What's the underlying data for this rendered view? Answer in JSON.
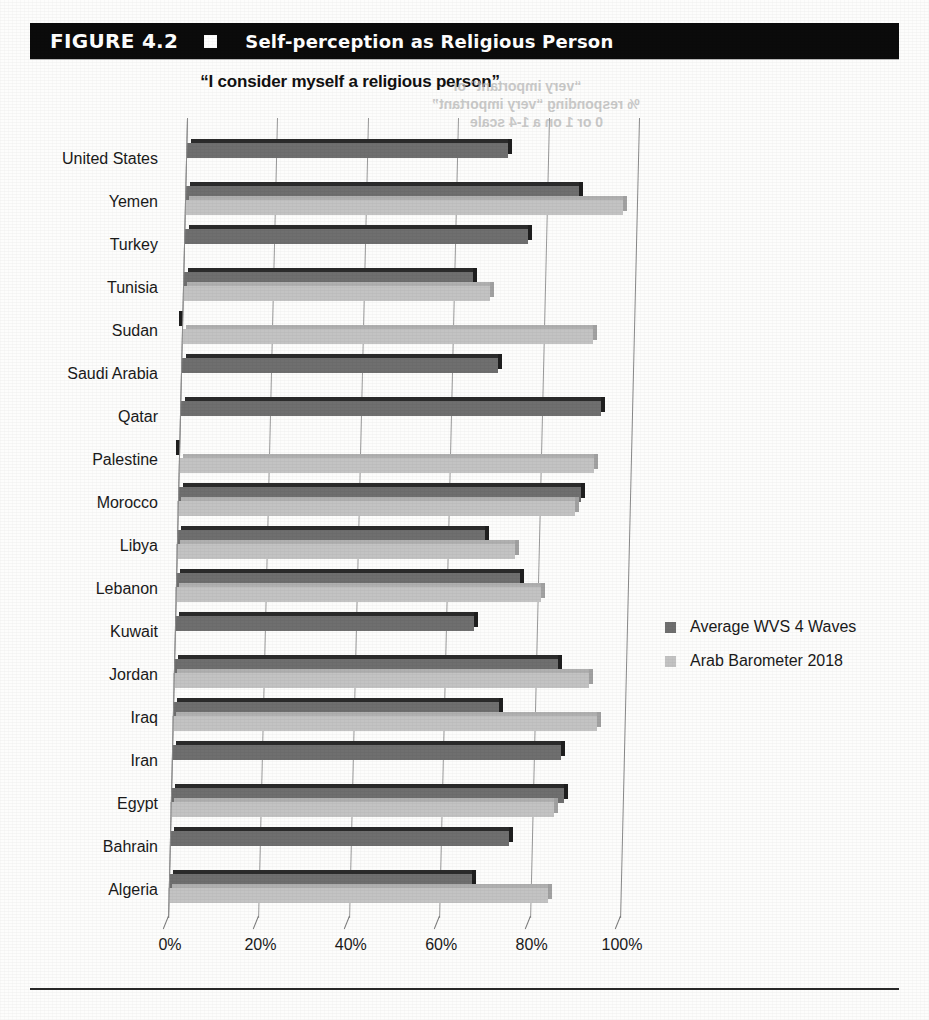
{
  "header": {
    "figure_number": "FIGURE 4.2",
    "title": "Self-perception as Religious Person",
    "marker_icon": "filled-square-icon"
  },
  "subtitle": "“I consider myself a religious person”",
  "scan_artifact": {
    "note": "mirrored bleed-through text from reverse page",
    "line1": "“very important” or",
    "line2": "% responding “very important”",
    "line3": "0 or 1 on a 1-4 scale"
  },
  "legend": {
    "position": "right",
    "items": [
      {
        "label": "Average WVS 4 Waves",
        "color": "#6f6f6f",
        "swatch_icon": "legend-swatch-icon"
      },
      {
        "label": "Arab Barometer 2018",
        "color": "#c3c3c3",
        "swatch_icon": "legend-swatch-icon"
      }
    ]
  },
  "axis": {
    "x_ticks": [
      "0%",
      "20%",
      "40%",
      "60%",
      "80%",
      "100%"
    ],
    "x_min": 0,
    "x_max": 100
  },
  "chart_data": {
    "type": "bar",
    "orientation": "horizontal",
    "title": "Self-perception as Religious Person",
    "subtitle": "“I consider myself a religious person”",
    "xlabel": "",
    "ylabel": "",
    "xlim": [
      0,
      100
    ],
    "xticks": [
      0,
      20,
      40,
      60,
      80,
      100
    ],
    "xtick_labels": [
      "0%",
      "20%",
      "40%",
      "60%",
      "80%",
      "100%"
    ],
    "grid": true,
    "legend_position": "right",
    "units": "percent",
    "categories": [
      "United States",
      "Yemen",
      "Turkey",
      "Tunisia",
      "Sudan",
      "Saudi Arabia",
      "Qatar",
      "Palestine",
      "Morocco",
      "Libya",
      "Lebanon",
      "Kuwait",
      "Jordan",
      "Iraq",
      "Iran",
      "Egypt",
      "Bahrain",
      "Algeria"
    ],
    "series": [
      {
        "name": "Average WVS 4 Waves",
        "color": "#6f6f6f",
        "values": [
          71,
          87,
          76,
          64,
          null,
          70,
          93,
          null,
          89,
          68,
          76,
          66,
          85,
          72,
          86,
          87,
          75,
          67
        ]
      },
      {
        "name": "Arab Barometer 2018",
        "color": "#c3c3c3",
        "values": [
          null,
          97,
          null,
          68,
          91,
          null,
          null,
          92,
          88,
          75,
          81,
          null,
          92,
          94,
          null,
          85,
          null,
          84
        ]
      }
    ]
  }
}
